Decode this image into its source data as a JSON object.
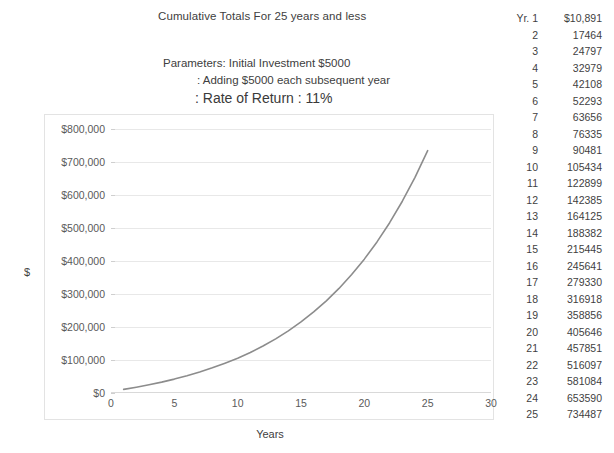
{
  "chart_title": "Cumulative Totals For 25 years and less",
  "parameters": {
    "line1": "Parameters: Initial Investment $5000",
    "line2": ": Adding $5000 each subsequent year",
    "line3": ": Rate of Return : 11%"
  },
  "axes": {
    "y_title": "$",
    "x_title": "Years",
    "y_ticks": [
      "$800,000",
      "$700,000",
      "$600,000",
      "$500,000",
      "$400,000",
      "$300,000",
      "$200,000",
      "$100,000",
      "$0"
    ],
    "x_ticks": [
      "0",
      "5",
      "10",
      "15",
      "20",
      "25",
      "30"
    ]
  },
  "table": {
    "first_row_year_label": "Yr. 1",
    "first_row_value_label": "$10,891",
    "rows": [
      {
        "year": "Yr. 1",
        "value": "$10,891"
      },
      {
        "year": "2",
        "value": "17464"
      },
      {
        "year": "3",
        "value": "24797"
      },
      {
        "year": "4",
        "value": "32979"
      },
      {
        "year": "5",
        "value": "42108"
      },
      {
        "year": "6",
        "value": "52293"
      },
      {
        "year": "7",
        "value": "63656"
      },
      {
        "year": "8",
        "value": "76335"
      },
      {
        "year": "9",
        "value": "90481"
      },
      {
        "year": "10",
        "value": "105434"
      },
      {
        "year": "11",
        "value": "122899"
      },
      {
        "year": "12",
        "value": "142385"
      },
      {
        "year": "13",
        "value": "164125"
      },
      {
        "year": "14",
        "value": "188382"
      },
      {
        "year": "15",
        "value": "215445"
      },
      {
        "year": "16",
        "value": "245641"
      },
      {
        "year": "17",
        "value": "279330"
      },
      {
        "year": "18",
        "value": "316918"
      },
      {
        "year": "19",
        "value": "358856"
      },
      {
        "year": "20",
        "value": "405646"
      },
      {
        "year": "21",
        "value": "457851"
      },
      {
        "year": "22",
        "value": "516097"
      },
      {
        "year": "23",
        "value": "581084"
      },
      {
        "year": "24",
        "value": "653590"
      },
      {
        "year": "25",
        "value": "734487"
      }
    ]
  },
  "colors": {
    "line": "#8c8c8c",
    "grid": "#e8e8e8",
    "frame": "#e3e3e3",
    "text": "#404040"
  },
  "chart_data": {
    "type": "line",
    "title": "Cumulative Totals For 25 years and less",
    "xlabel": "Years",
    "ylabel": "$",
    "xlim": [
      0,
      30
    ],
    "ylim": [
      0,
      800000
    ],
    "grid": true,
    "legend": "none",
    "x": [
      1,
      2,
      3,
      4,
      5,
      6,
      7,
      8,
      9,
      10,
      11,
      12,
      13,
      14,
      15,
      16,
      17,
      18,
      19,
      20,
      21,
      22,
      23,
      24,
      25
    ],
    "series": [
      {
        "name": "Cumulative Total",
        "values": [
          10891,
          17464,
          24797,
          32979,
          42108,
          52293,
          63656,
          76335,
          90481,
          105434,
          122899,
          142385,
          164125,
          188382,
          215445,
          245641,
          279330,
          316918,
          358856,
          405646,
          457851,
          516097,
          581084,
          653590,
          734487
        ]
      }
    ],
    "annotations": [
      "Parameters: Initial Investment $5000",
      ": Adding $5000 each subsequent year",
      ": Rate of Return : 11%"
    ]
  }
}
